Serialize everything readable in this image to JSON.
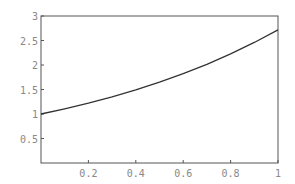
{
  "chart_data": {
    "type": "line",
    "title": "",
    "xlabel": "",
    "ylabel": "",
    "xlim": [
      0,
      1
    ],
    "ylim": [
      0,
      3
    ],
    "grid": false,
    "legend": null,
    "x_ticks": [
      "0.2",
      "0.4",
      "0.6",
      "0.8",
      "1"
    ],
    "y_ticks": [
      "0.5",
      "1",
      "1.5",
      "2",
      "2.5",
      "3"
    ],
    "series": [
      {
        "name": "exp(x)",
        "x": [
          0,
          0.1,
          0.2,
          0.3,
          0.4,
          0.5,
          0.6,
          0.7,
          0.8,
          0.9,
          1.0
        ],
        "values": [
          1.0,
          1.105,
          1.221,
          1.35,
          1.492,
          1.649,
          1.822,
          2.014,
          2.226,
          2.46,
          2.718
        ]
      }
    ],
    "colors": {
      "line": "#333333",
      "frame": "#555555",
      "ticks_text": "#888888"
    }
  }
}
